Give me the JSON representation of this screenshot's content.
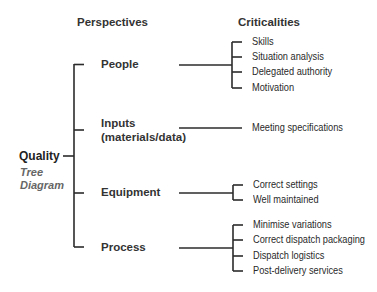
{
  "headers": {
    "perspectives": "Perspectives",
    "criticalities": "Criticalities"
  },
  "root": {
    "label": "Quality",
    "subtitle_line1": "Tree",
    "subtitle_line2": "Diagram"
  },
  "perspectives": [
    {
      "label": "People",
      "criticalities": [
        "Skills",
        "Situation analysis",
        "Delegated authority",
        "Motivation"
      ]
    },
    {
      "label_line1": "Inputs",
      "label_line2": "(materials/data)",
      "criticalities": [
        "Meeting specifications"
      ]
    },
    {
      "label": "Equipment",
      "criticalities": [
        "Correct settings",
        "Well maintained"
      ]
    },
    {
      "label": "Process",
      "criticalities": [
        "Minimise variations",
        "Correct dispatch packaging",
        "Dispatch logistics",
        "Post-delivery services"
      ]
    }
  ],
  "colors": {
    "line": "#2b2b2b",
    "text": "#222222",
    "subtitle": "#666666"
  }
}
